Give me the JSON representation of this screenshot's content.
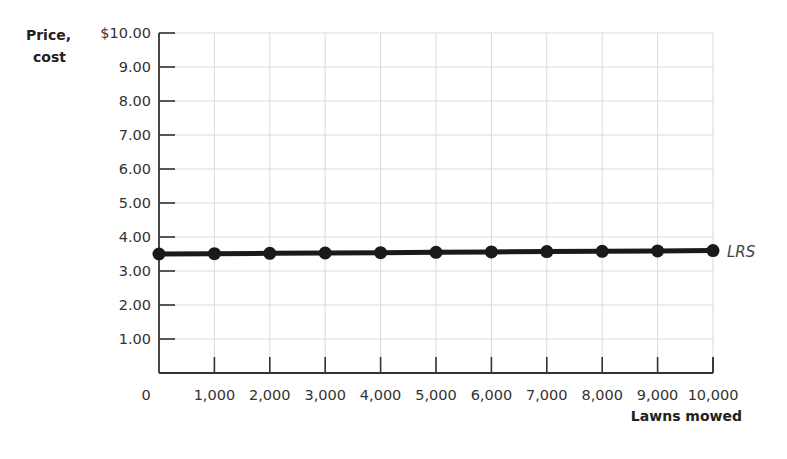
{
  "chart_data": {
    "type": "line",
    "title": "",
    "xlabel": "Lawns mowed",
    "ylabel": "Price, cost",
    "ylabel_lines": [
      "Price,",
      "cost"
    ],
    "x": [
      0,
      1000,
      2000,
      3000,
      4000,
      5000,
      6000,
      7000,
      8000,
      9000,
      10000
    ],
    "x_tick_labels": [
      "0",
      "1,000",
      "2,000",
      "3,000",
      "4,000",
      "5,000",
      "6,000",
      "7,000",
      "8,000",
      "9,000",
      "10,000"
    ],
    "y_ticks": [
      1,
      2,
      3,
      4,
      5,
      6,
      7,
      8,
      9,
      10
    ],
    "y_tick_labels": [
      "1.00",
      "2.00",
      "3.00",
      "4.00",
      "5.00",
      "6.00",
      "7.00",
      "8.00",
      "9.00",
      "$10.00"
    ],
    "xlim": [
      0,
      10000
    ],
    "ylim": [
      0,
      10
    ],
    "grid": true,
    "legend": "none (direct label at line end)",
    "series": [
      {
        "name": "LRS",
        "color": "#1a1a1a",
        "markers": true,
        "values": [
          3.5,
          3.51,
          3.52,
          3.53,
          3.54,
          3.55,
          3.56,
          3.57,
          3.58,
          3.59,
          3.6
        ]
      }
    ]
  },
  "colors": {
    "line": "#1a1a1a",
    "axis": "#333333",
    "grid": "#d9d9d9",
    "text": "#333333"
  }
}
